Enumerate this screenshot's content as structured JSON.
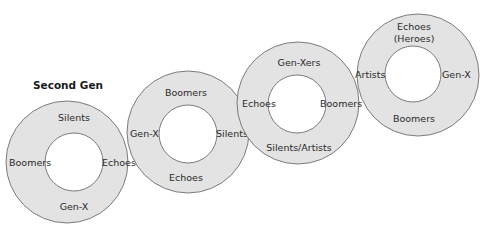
{
  "diagram": {
    "title": "Second Gen",
    "colors": {
      "ring_fill": "#e3e3e3",
      "ring_stroke": "#6e6e6e",
      "hole_fill": "#ffffff",
      "text": "#2a2a2a"
    },
    "rings": [
      {
        "id": "ring-1",
        "cx": 67,
        "cy": 162,
        "r": 61,
        "hole_cx": 74,
        "hole_cy": 162,
        "hole_r": 29,
        "top": "Silents",
        "left": "Boomers",
        "right": "Echoes",
        "bottom": "Gen-X"
      },
      {
        "id": "ring-2",
        "cx": 188,
        "cy": 132,
        "r": 61,
        "hole_cx": 188,
        "hole_cy": 134,
        "hole_r": 29,
        "top": "Boomers",
        "left": "Gen-X",
        "right": "Silents",
        "bottom": "Echoes"
      },
      {
        "id": "ring-3",
        "cx": 298,
        "cy": 103,
        "r": 61,
        "hole_cx": 297,
        "hole_cy": 104,
        "hole_r": 29,
        "top": "Gen-Xers",
        "left": "Echoes",
        "right": "Boomers",
        "bottom": "Silents/Artists"
      },
      {
        "id": "ring-4",
        "cx": 418,
        "cy": 75,
        "r": 61,
        "hole_cx": 413,
        "hole_cy": 74,
        "hole_r": 28,
        "top_line1": "Echoes",
        "top_line2": "(Heroes)",
        "left": "Artists",
        "right": "Gen-X",
        "bottom": "Boomers"
      }
    ]
  }
}
